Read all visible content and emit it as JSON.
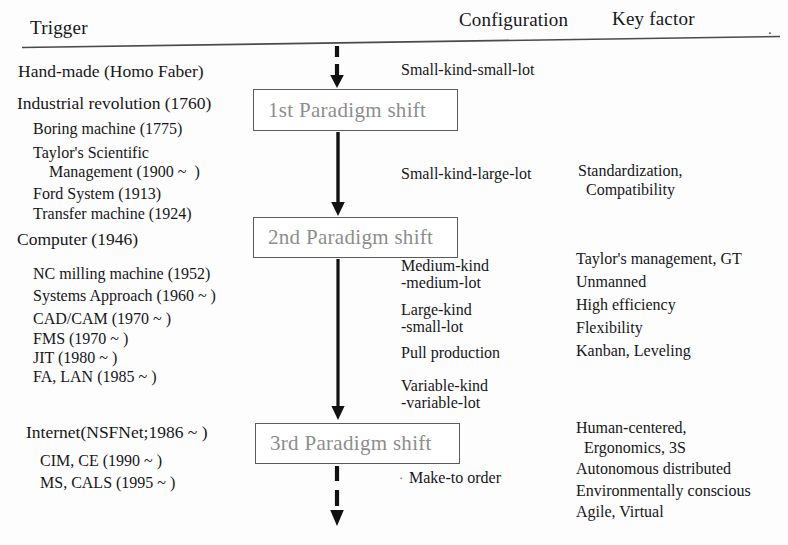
{
  "headers": {
    "trigger": "Trigger",
    "configuration": "Configuration",
    "key_factor": "Key factor",
    "trailing_mark": "."
  },
  "colors": {
    "text": "#16161a",
    "box_border": "#5b5b5b",
    "box_label": "#8d8d8d",
    "rule": "#4a4a4a",
    "arrow": "#111111"
  },
  "trigger_column": {
    "groups": [
      {
        "heading": "Hand-made (Homo Faber)",
        "items": []
      },
      {
        "heading": "Industrial revolution (1760)",
        "items": [
          "Boring machine (1775)",
          "Taylor's Scientific",
          "    Management (1900 ~  )",
          "Ford System (1913)",
          "Transfer machine (1924)"
        ]
      },
      {
        "heading": "Computer (1946)",
        "items": [
          "NC milling machine (1952)",
          "Systems Approach (1960 ~ )",
          "CAD/CAM (1970 ~ )",
          "FMS (1970 ~ )",
          "JIT (1980 ~ )",
          "FA, LAN (1985 ~ )"
        ]
      },
      {
        "heading": "Internet(NSFNet;1986 ~ )",
        "items": [
          "CIM, CE (1990 ~ )",
          "MS, CALS (1995 ~ )"
        ]
      }
    ]
  },
  "paradigm_boxes": [
    {
      "label": "1st Paradigm shift"
    },
    {
      "label": "2nd Paradigm shift"
    },
    {
      "label": "3rd Paradigm shift"
    }
  ],
  "configuration_column": {
    "entries": [
      "Small-kind-small-lot",
      "Small-kind-large-lot",
      "Medium-kind",
      "-medium-lot",
      "Large-kind",
      "-small-lot",
      "Pull production",
      "Variable-kind",
      "-variable-lot",
      "Make-to order"
    ]
  },
  "key_factor_column": {
    "entries": [
      "Standardization,",
      "  Compatibility",
      "Taylor's management, GT",
      "Unmanned",
      "High efficiency",
      "Flexibility",
      "Kanban, Leveling",
      "Human-centered,",
      "  Ergonomics, 3S",
      "Autonomous distributed",
      "Environmentally conscious",
      "Agile, Virtual"
    ]
  },
  "arrows": [
    {
      "name": "top-dashed-arrow",
      "style": "dashed"
    },
    {
      "name": "first-to-second-arrow",
      "style": "solid"
    },
    {
      "name": "second-to-third-arrow",
      "style": "solid"
    },
    {
      "name": "bottom-dashed-arrow",
      "style": "dashed"
    }
  ]
}
